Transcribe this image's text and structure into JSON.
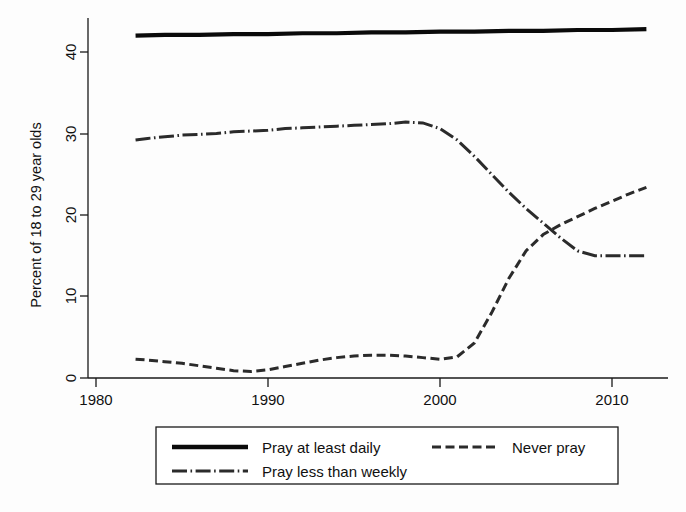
{
  "chart_data": {
    "type": "line",
    "title": "",
    "subtitle": "",
    "xlabel": "",
    "ylabel": "Percent of 18 to 29 year olds",
    "xlim": [
      1978.6,
      2013.6
    ],
    "ylim": [
      0,
      46.5
    ],
    "xticks": [
      1980,
      1990,
      2000,
      2010
    ],
    "xticklabels": [
      "1980",
      "1990",
      "2000",
      "2010"
    ],
    "yticks": [
      0,
      10,
      20,
      30,
      40
    ],
    "yticklabels": [
      "0",
      "10",
      "20",
      "30",
      "40"
    ],
    "grid": false,
    "legend_position": "below-axes",
    "series": [
      {
        "name": "Pray at least daily",
        "style": "solid",
        "color": "#0a0a0a",
        "x": [
          1982.3,
          1984,
          1986,
          1988,
          1990,
          1992,
          1994,
          1996,
          1998,
          2000,
          2002,
          2004,
          2006,
          2008,
          2010,
          2012
        ],
        "values": [
          42.0,
          42.1,
          42.1,
          42.2,
          42.2,
          42.3,
          42.3,
          42.4,
          42.4,
          42.5,
          42.5,
          42.6,
          42.6,
          42.7,
          42.7,
          42.8
        ]
      },
      {
        "name": "Never pray",
        "style": "dashed",
        "color": "#2b2b2b",
        "x": [
          1982.3,
          1983,
          1984,
          1985,
          1986,
          1987,
          1988,
          1989,
          1990,
          1991,
          1992,
          1993,
          1994,
          1995,
          1996,
          1997,
          1998,
          1999,
          2000,
          2001,
          2002,
          2003,
          2004,
          2005,
          2006,
          2007,
          2008,
          2009,
          2010,
          2011,
          2012
        ],
        "values": [
          2.3,
          2.2,
          2.0,
          1.8,
          1.5,
          1.2,
          0.9,
          0.8,
          1.0,
          1.4,
          1.8,
          2.2,
          2.5,
          2.7,
          2.8,
          2.8,
          2.7,
          2.5,
          2.3,
          2.6,
          4.3,
          8.0,
          12.2,
          15.6,
          17.6,
          18.8,
          19.8,
          20.8,
          21.7,
          22.6,
          23.4
        ]
      },
      {
        "name": "Pray less than weekly",
        "style": "dash-dot",
        "color": "#2b2b2b",
        "x": [
          1982.3,
          1983,
          1984,
          1985,
          1986,
          1987,
          1988,
          1989,
          1990,
          1991,
          1992,
          1993,
          1994,
          1995,
          1996,
          1997,
          1998,
          1999,
          2000,
          2001,
          2002,
          2003,
          2004,
          2005,
          2006,
          2007,
          2008,
          2009,
          2010,
          2011,
          2012
        ],
        "values": [
          29.2,
          29.4,
          29.6,
          29.8,
          29.9,
          30.0,
          30.2,
          30.3,
          30.4,
          30.6,
          30.7,
          30.8,
          30.9,
          31.0,
          31.1,
          31.2,
          31.4,
          31.3,
          30.6,
          29.2,
          27.2,
          25.0,
          22.8,
          20.8,
          19.0,
          17.2,
          15.6,
          15.0,
          15.0,
          15.0,
          15.0
        ]
      }
    ],
    "legend_entries": [
      {
        "label": "Pray at least daily",
        "style": "solid"
      },
      {
        "label": "Never pray",
        "style": "dashed"
      },
      {
        "label": "Pray less than weekly",
        "style": "dash-dot"
      }
    ]
  },
  "axes": {
    "ylabel": "Percent of 18 to 29 year olds",
    "ytick_0": "0",
    "ytick_10": "10",
    "ytick_20": "20",
    "ytick_30": "30",
    "ytick_40": "40",
    "xtick_1980": "1980",
    "xtick_1990": "1990",
    "xtick_2000": "2000",
    "xtick_2010": "2010"
  },
  "legend": {
    "entry_1": "Pray at least daily",
    "entry_2": "Never pray",
    "entry_3": "Pray less than weekly"
  },
  "colors": {
    "ink": "#111111",
    "series_solid": "#0a0a0a",
    "series_dashed": "#2b2b2b",
    "background": "#fdfdfd"
  }
}
